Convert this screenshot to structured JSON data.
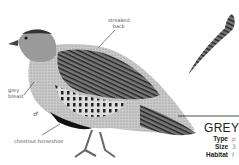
{
  "page": {
    "labels": {
      "streaked_back": [
        "streaked",
        "back"
      ],
      "grey_breast": [
        "grey",
        "breast"
      ],
      "male_symbol": "♂",
      "chestnut_horseshoe": "chestnut horseshoe"
    },
    "species_card": {
      "title": "GREY",
      "fields": [
        {
          "name": "Type",
          "value": "p"
        },
        {
          "name": "Size",
          "value": "3"
        },
        {
          "name": "Habitat",
          "value": "f"
        }
      ]
    }
  }
}
